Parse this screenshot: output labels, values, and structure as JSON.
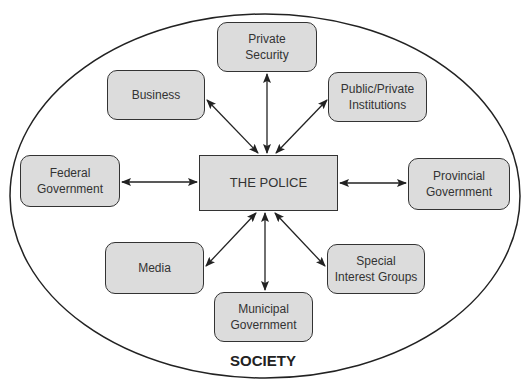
{
  "diagram": {
    "boundary_label": "SOCIETY",
    "center": {
      "id": "police",
      "label": "THE POLICE"
    },
    "nodes": [
      {
        "id": "private-security",
        "label": "Private\nSecurity"
      },
      {
        "id": "business",
        "label": "Business"
      },
      {
        "id": "public-private-institutions",
        "label": "Public/Private\nInstitutions"
      },
      {
        "id": "federal-government",
        "label": "Federal\nGovernment"
      },
      {
        "id": "provincial-government",
        "label": "Provincial\nGovernment"
      },
      {
        "id": "media",
        "label": "Media"
      },
      {
        "id": "municipal-government",
        "label": "Municipal\nGovernment"
      },
      {
        "id": "special-interest-groups",
        "label": "Special\nInterest Groups"
      }
    ],
    "edges": [
      {
        "from": "police",
        "to": "private-security",
        "direction": "both"
      },
      {
        "from": "police",
        "to": "business",
        "direction": "both"
      },
      {
        "from": "police",
        "to": "public-private-institutions",
        "direction": "both"
      },
      {
        "from": "police",
        "to": "federal-government",
        "direction": "both"
      },
      {
        "from": "police",
        "to": "provincial-government",
        "direction": "both"
      },
      {
        "from": "police",
        "to": "media",
        "direction": "both"
      },
      {
        "from": "police",
        "to": "municipal-government",
        "direction": "both"
      },
      {
        "from": "police",
        "to": "special-interest-groups",
        "direction": "both"
      }
    ],
    "colors": {
      "node_fill": "#dcdcdc",
      "stroke": "#333333",
      "background": "#ffffff"
    }
  }
}
